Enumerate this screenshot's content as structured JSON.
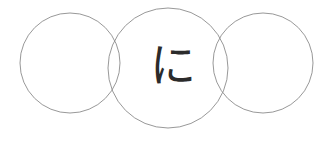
{
  "image": {
    "title": "Three overlapping thin circles with a handwritten-style Japanese kana",
    "width": 314,
    "height": 146,
    "background_color": "#ffffff"
  },
  "text": {
    "kana": "に",
    "kana_romaji": "ni",
    "kana_color": "#2b2b2b",
    "kana_left": 148,
    "kana_top": 36,
    "kana_font_size": 46
  },
  "shapes": {
    "stroke_color": "#8c8c8c",
    "stroke_width": 0.9,
    "fill": "none",
    "circles": [
      {
        "name": "left-circle",
        "cx": 70,
        "cy": 63,
        "r": 50
      },
      {
        "name": "middle-circle",
        "cx": 168,
        "cy": 68,
        "r": 60
      },
      {
        "name": "right-circle",
        "cx": 263,
        "cy": 63,
        "r": 50
      }
    ]
  }
}
